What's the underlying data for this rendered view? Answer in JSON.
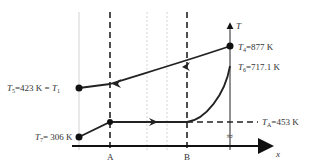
{
  "diagram": {
    "axis": {
      "x_label": "x",
      "y_label": "T"
    },
    "markers": {
      "a": "A",
      "b": "B"
    },
    "labels": {
      "t5": {
        "sym": "T",
        "sub": "5",
        "val": "=423 K = ",
        "sym2": "T",
        "sub2": "1"
      },
      "t7": {
        "sym": "T",
        "sub": "7",
        "val": "= 306 K"
      },
      "t4": {
        "sym": "T",
        "sub": "4",
        "val": "=877 K"
      },
      "t6": {
        "sym": "T",
        "sub": "6",
        "val": "=717.1 K"
      },
      "ta": {
        "sym": "T",
        "sub": "A",
        "val": "=453 K"
      }
    },
    "break_symbol": "≈",
    "colors": {
      "line": "#222222",
      "grid": "#bbbbbb",
      "axis": "#111111"
    }
  }
}
